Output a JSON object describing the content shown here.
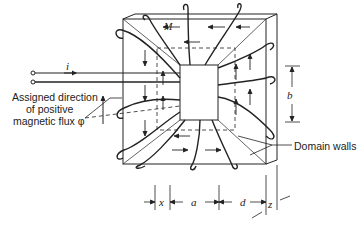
{
  "figure": {
    "type": "ferromagnetic toroidal core with winding and domain walls",
    "labels": {
      "current": "i",
      "magnetization": "M",
      "flux_label_line1": "Assigned direction",
      "flux_label_line2": "of positive",
      "flux_label_line3": "magnetic flux φ",
      "domain_walls": "Domain walls"
    },
    "dimensions": {
      "x": "x",
      "a": "a",
      "d": "d",
      "z": "z",
      "b": "b"
    },
    "colors": {
      "line": "#222222",
      "background": "#ffffff"
    }
  }
}
